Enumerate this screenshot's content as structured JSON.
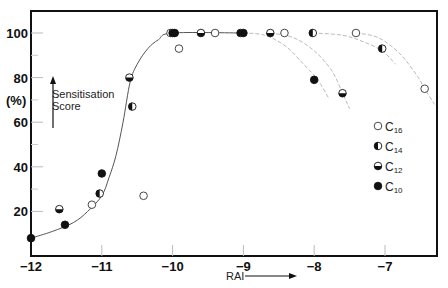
{
  "chart_data": {
    "type": "scatter",
    "title": "",
    "xlabel": "RAI",
    "ylabel": "Sensitisation Score",
    "ylabel_unit": "(%)",
    "xlim": [
      -12,
      -6.28
    ],
    "ylim": [
      0,
      100
    ],
    "x_ticks": [
      -12,
      -11,
      -10,
      -9,
      -8,
      -7
    ],
    "x_tick_labels": [
      "−12",
      "−11",
      "−10",
      "−9",
      "−8",
      "−7"
    ],
    "y_ticks": [
      20,
      40,
      60,
      80,
      100
    ],
    "y_tick_labels": [
      "20",
      "40",
      "60",
      "80",
      "100"
    ],
    "y_minor_ticks": [
      30,
      50,
      70,
      90
    ],
    "grid": false,
    "legend_position": "right-middle-inside",
    "series": [
      {
        "name": "C16",
        "label_base": "C",
        "label_sub": "16",
        "marker": "open",
        "points": [
          {
            "x": -11.14,
            "y": 23
          },
          {
            "x": -10.41,
            "y": 27
          },
          {
            "x": -10.03,
            "y": 100
          },
          {
            "x": -9.91,
            "y": 93
          },
          {
            "x": -9.4,
            "y": 100
          },
          {
            "x": -8.42,
            "y": 100
          },
          {
            "x": -7.41,
            "y": 100
          },
          {
            "x": -6.44,
            "y": 75
          }
        ]
      },
      {
        "name": "C14",
        "label_base": "C",
        "label_sub": "14",
        "marker": "left-half",
        "points": [
          {
            "x": -11.03,
            "y": 28
          },
          {
            "x": -10.57,
            "y": 67
          },
          {
            "x": -10.0,
            "y": 100
          },
          {
            "x": -9.04,
            "y": 100
          },
          {
            "x": -8.02,
            "y": 100
          },
          {
            "x": -7.04,
            "y": 93
          }
        ]
      },
      {
        "name": "C12",
        "label_base": "C",
        "label_sub": "12",
        "marker": "bottom-half",
        "points": [
          {
            "x": -11.6,
            "y": 21
          },
          {
            "x": -10.61,
            "y": 80
          },
          {
            "x": -9.6,
            "y": 100
          },
          {
            "x": -8.62,
            "y": 100
          },
          {
            "x": -7.6,
            "y": 73
          }
        ]
      },
      {
        "name": "C10",
        "label_base": "C",
        "label_sub": "10",
        "marker": "filled",
        "points": [
          {
            "x": -12.0,
            "y": 8
          },
          {
            "x": -11.52,
            "y": 14
          },
          {
            "x": -11.0,
            "y": 37
          },
          {
            "x": -9.97,
            "y": 100
          },
          {
            "x": -9.0,
            "y": 100
          },
          {
            "x": -8.0,
            "y": 79
          }
        ]
      }
    ],
    "curves": [
      {
        "name": "rising-fit",
        "style": "solid",
        "color": "#555555",
        "points": [
          [
            -12,
            8
          ],
          [
            -11.7,
            11
          ],
          [
            -11.4,
            15
          ],
          [
            -11.2,
            20
          ],
          [
            -11.0,
            27
          ],
          [
            -10.9,
            35
          ],
          [
            -10.8,
            45
          ],
          [
            -10.7,
            60
          ],
          [
            -10.6,
            78
          ],
          [
            -10.5,
            86
          ],
          [
            -10.35,
            93
          ],
          [
            -10.2,
            97
          ],
          [
            -10.0,
            100
          ],
          [
            -9.0,
            100
          ]
        ]
      },
      {
        "name": "C10-decline",
        "style": "dashed",
        "color": "#bbbbbb",
        "points": [
          [
            -9.0,
            100
          ],
          [
            -8.7,
            99
          ],
          [
            -8.4,
            94
          ],
          [
            -8.15,
            86
          ],
          [
            -7.95,
            79
          ],
          [
            -7.8,
            71
          ]
        ]
      },
      {
        "name": "C12-decline",
        "style": "dashed",
        "color": "#bbbbbb",
        "points": [
          [
            -8.62,
            100
          ],
          [
            -8.3,
            98
          ],
          [
            -8.0,
            92
          ],
          [
            -7.75,
            83
          ],
          [
            -7.6,
            73
          ],
          [
            -7.5,
            66
          ]
        ]
      },
      {
        "name": "C14-decline",
        "style": "dashed",
        "color": "#bbbbbb",
        "points": [
          [
            -8.02,
            100
          ],
          [
            -7.6,
            99
          ],
          [
            -7.3,
            96
          ],
          [
            -7.04,
            92
          ],
          [
            -6.85,
            86
          ]
        ]
      },
      {
        "name": "C16-decline",
        "style": "dashed",
        "color": "#bbbbbb",
        "points": [
          [
            -7.41,
            100
          ],
          [
            -7.1,
            98
          ],
          [
            -6.8,
            91
          ],
          [
            -6.55,
            81
          ],
          [
            -6.44,
            75
          ],
          [
            -6.3,
            68
          ]
        ]
      }
    ]
  },
  "annotations": {
    "ylabel_line1": "Sensitisation",
    "ylabel_line2": "Score",
    "ylabel_unit": "(%)",
    "xlabel": "RAI"
  },
  "legend": [
    {
      "marker": "open",
      "base": "C",
      "sub": "16"
    },
    {
      "marker": "left-half",
      "base": "C",
      "sub": "14"
    },
    {
      "marker": "bottom-half",
      "base": "C",
      "sub": "12"
    },
    {
      "marker": "filled",
      "base": "C",
      "sub": "10"
    }
  ],
  "colors": {
    "axis": "#111111",
    "marker": "#111111",
    "fit_line": "#555555",
    "dashed": "#bbbbbb",
    "background": "#ffffff"
  }
}
